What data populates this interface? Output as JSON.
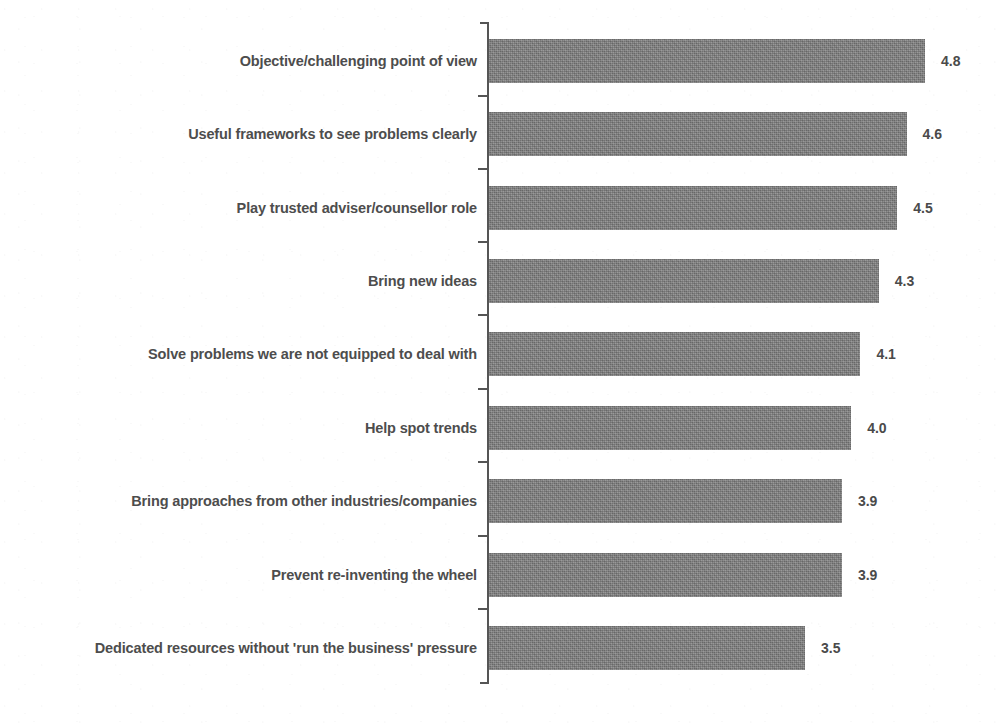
{
  "chart_data": {
    "type": "bar",
    "orientation": "horizontal",
    "title": "",
    "subtitle": "",
    "xlabel": "",
    "ylabel": "",
    "xlim": [
      0,
      5
    ],
    "grid": false,
    "legend": null,
    "value_labels_shown": true,
    "categories": [
      "Objective/challenging point of view",
      "Useful frameworks to see problems clearly",
      "Play trusted adviser/counsellor role",
      "Bring new ideas",
      "Solve problems we are not equipped to deal with",
      "Help spot trends",
      "Bring approaches from other industries/companies",
      "Prevent re-inventing the wheel",
      "Dedicated resources without 'run the business' pressure"
    ],
    "values": [
      4.8,
      4.6,
      4.5,
      4.3,
      4.1,
      4.0,
      3.9,
      3.9,
      3.5
    ],
    "value_labels": [
      "4.8",
      "4.6",
      "4.5",
      "4.3",
      "4.1",
      "4.0",
      "3.9",
      "3.9",
      "3.5"
    ],
    "bar_color": "#7c7c7c",
    "axis_color": "#555555",
    "text_color": "#4d4d4d",
    "background": "#ffffff"
  }
}
